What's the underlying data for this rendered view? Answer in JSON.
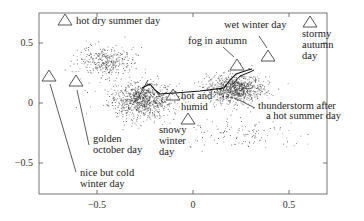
{
  "chart_data": {
    "type": "scatter",
    "title": "",
    "xlabel": "",
    "ylabel": "",
    "xlim": [
      -0.8,
      0.7
    ],
    "ylim": [
      -0.75,
      0.75
    ],
    "grid": false,
    "legend": null,
    "x_ticks": [
      -0.5,
      0,
      0.5
    ],
    "x_tick_labels": [
      "−0.5",
      "0",
      "0.5"
    ],
    "y_ticks": [
      -0.5,
      0,
      0.5
    ],
    "y_tick_labels": [
      "−0.5",
      "0",
      "0.5"
    ],
    "series": [
      {
        "name": "weather states (point cloud)",
        "marker": "dot",
        "clusters": [
          {
            "center": [
              -0.27,
              0.03
            ],
            "spread": [
              0.14,
              0.12
            ],
            "density": "high"
          },
          {
            "center": [
              -0.45,
              0.35
            ],
            "spread": [
              0.12,
              0.1
            ],
            "density": "medium"
          },
          {
            "center": [
              0.22,
              0.12
            ],
            "spread": [
              0.12,
              0.1
            ],
            "density": "high"
          },
          {
            "center": [
              0.25,
              -0.25
            ],
            "spread": [
              0.25,
              0.1
            ],
            "density": "low"
          }
        ]
      },
      {
        "name": "prototype days",
        "marker": "triangle",
        "points": [
          {
            "label": "hot dry summer day",
            "x": -0.67,
            "y": 0.69
          },
          {
            "label": "nice but cold winter day",
            "x": -0.75,
            "y": 0.22
          },
          {
            "label": "golden october day",
            "x": -0.61,
            "y": 0.18
          },
          {
            "label": "hot and humid",
            "x": -0.1,
            "y": 0.07
          },
          {
            "label": "snowy winter day",
            "x": -0.03,
            "y": -0.12
          },
          {
            "label": "fog in autumn",
            "x": 0.23,
            "y": 0.33
          },
          {
            "label": "wet winter day",
            "x": 0.39,
            "y": 0.4
          },
          {
            "label": "stormy autumn day",
            "x": 0.61,
            "y": 0.68
          }
        ]
      },
      {
        "name": "trajectory",
        "marker": "line",
        "points": [
          [
            -0.3,
            0.1
          ],
          [
            -0.25,
            0.12
          ],
          [
            -0.22,
            0.08
          ],
          [
            0.2,
            0.13
          ],
          [
            0.22,
            0.22
          ],
          [
            0.3,
            0.25
          ],
          [
            0.33,
            0.27
          ]
        ]
      }
    ],
    "annotations": [
      {
        "text": "hot dry summer day",
        "x": -0.67,
        "y": 0.69
      },
      {
        "text": "golden october day",
        "x": -0.61,
        "y": -0.3
      },
      {
        "text": "nice but cold winter day",
        "x": -0.75,
        "y": -0.57
      },
      {
        "text": "hot and humid",
        "x": -0.08,
        "y": 0.07
      },
      {
        "text": "snowy winter day",
        "x": -0.12,
        "y": -0.3
      },
      {
        "text": "fog in autumn",
        "x": 0.14,
        "y": 0.47
      },
      {
        "text": "wet winter day",
        "x": 0.3,
        "y": 0.67
      },
      {
        "text": "stormy autumn day",
        "x": 0.6,
        "y": 0.55
      },
      {
        "text": "thunderstorm after a hot summer day",
        "x": 0.4,
        "y": -0.05
      }
    ]
  },
  "labels": {
    "hot_dry": "hot dry summer day",
    "golden_1": "golden",
    "golden_2": "october day",
    "nice_1": "nice but cold",
    "nice_2": "winter day",
    "hot_humid_1": "hot and",
    "hot_humid_2": "humid",
    "snowy_1": "snowy",
    "snowy_2": "winter",
    "snowy_3": "day",
    "fog": "fog in autumn",
    "wet": "wet winter day",
    "stormy_1": "stormy",
    "stormy_2": "autumn",
    "stormy_3": "day",
    "thunder_1": "thunderstorm after",
    "thunder_2": "a hot summer day"
  },
  "ticks": {
    "x_neg": "−0.5",
    "x_zero": "0",
    "x_pos": "0.5",
    "y_pos": "0.5",
    "y_zero": "0",
    "y_neg": "−0.5"
  }
}
